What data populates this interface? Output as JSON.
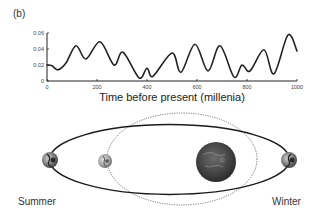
{
  "panel": {
    "label": "(b)"
  },
  "chart_data": {
    "type": "line",
    "title": "",
    "xlabel": "Time before present (millenia)",
    "ylabel": "",
    "xlim": [
      0,
      1000
    ],
    "ylim": [
      0,
      0.06
    ],
    "xticks": [
      0,
      200,
      400,
      600,
      800,
      1000
    ],
    "xtick_labels": [
      "0",
      "200",
      "400",
      "600",
      "800",
      "1000"
    ],
    "yticks": [
      0,
      0.02,
      0.04,
      0.06
    ],
    "ytick_labels": [
      "0",
      "0.02",
      "0.04",
      "0.06"
    ],
    "grid": false,
    "legend": null,
    "series": [
      {
        "name": "Orbital eccentricity",
        "x": [
          0,
          20,
          44,
          76,
          116,
          156,
          212,
          268,
          304,
          368,
          400,
          424,
          500,
          536,
          592,
          644,
          692,
          748,
          780,
          812,
          868,
          908,
          964,
          1000
        ],
        "values": [
          0.02,
          0.019,
          0.014,
          0.0225,
          0.044,
          0.0275,
          0.049,
          0.02,
          0.036,
          0.004,
          0.016,
          0.006,
          0.035,
          0.011,
          0.046,
          0.0125,
          0.044,
          0.005,
          0.02,
          0.0125,
          0.039,
          0.009,
          0.0575,
          0.0375
        ]
      }
    ]
  },
  "orbit_diagram": {
    "labels": {
      "left": "Summer",
      "right": "Winter"
    },
    "bodies": [
      "earth-left",
      "earth-middle",
      "sun",
      "earth-right"
    ],
    "orbits": [
      "eccentric-orbit-solid",
      "circular-orbit-dotted"
    ]
  }
}
